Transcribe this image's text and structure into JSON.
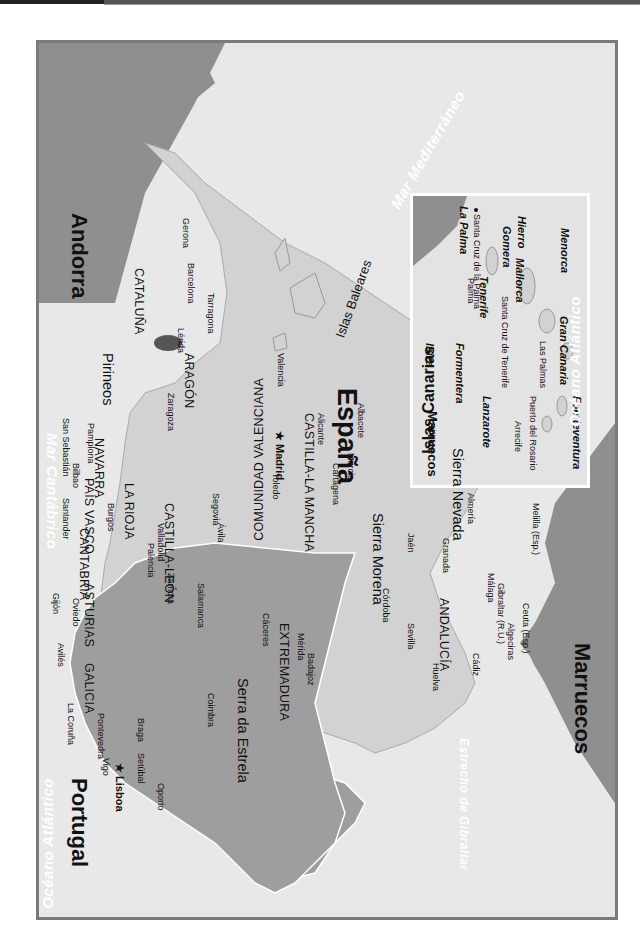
{
  "map": {
    "title": "España y Portugal",
    "orientation": "rotated 90° clockwise (north points right)",
    "colors": {
      "sea": "#e8e8e8",
      "spain_land": "#d2d2d2",
      "portugal_land": "#9e9e9e",
      "foreign_land": "#8f8f8f",
      "andorra": "#555555",
      "frame": "#7a7a7a",
      "sea_label": "#ffffff"
    },
    "countries": [
      {
        "name": "España"
      },
      {
        "name": "Portugal"
      },
      {
        "name": "Andorra"
      },
      {
        "name": "Marruecos"
      }
    ],
    "capitals": [
      {
        "name": "Madrid"
      },
      {
        "name": "Lisboa"
      }
    ],
    "regions": [
      "GALICIA",
      "ASTURIAS",
      "CANTABRIA",
      "PAÍS VASCO",
      "NAVARRA",
      "LA RIOJA",
      "ARAGÓN",
      "CATALUÑA",
      "CASTILLA-LEÓN",
      "CASTILLA-LA MANCHA",
      "COMUNIDAD VALENCIANA",
      "EXTREMADURA",
      "ANDALUCÍA"
    ],
    "mountains": [
      "Pirineos",
      "Sierra Morena",
      "Sierra Nevada",
      "Serra da Estrela"
    ],
    "seas": [
      "Mar Cantábrico",
      "Mar Mediterráneo",
      "Océano Atlántico",
      "Estrecho de Gibraltar"
    ],
    "cities": [
      "Gerona",
      "Barcelona",
      "Tarragona",
      "Lérida",
      "Zaragoza",
      "Valencia",
      "Alicante",
      "Cartagena",
      "Murcia",
      "Albacete",
      "San Sebastián",
      "Bilbao",
      "Pamplona",
      "Santander",
      "Burgos",
      "Gijón",
      "Oviedo",
      "Avilés",
      "La Coruña",
      "Pontevedra",
      "Vigo",
      "Palencia",
      "Valladolid",
      "Zamora",
      "Salamanca",
      "Ávila",
      "Segovia",
      "Toledo",
      "Cáceres",
      "Mérida",
      "Badajoz",
      "Córdoba",
      "Jaén",
      "Granada",
      "Almería",
      "Sevilla",
      "Huelva",
      "Cádiz",
      "Málaga",
      "Algeciras",
      "Gibraltar (R.U.)",
      "Ceuta (Esp.)",
      "Melilla (Esp.)",
      "Braga",
      "Oporto",
      "Coimbra",
      "Setúbal",
      "Palma"
    ],
    "balearics": {
      "group": "Islas Baleares",
      "islands": [
        "Menorca",
        "Mallorca",
        "Ibiza",
        "Formentera"
      ]
    },
    "canarias_inset": {
      "title": "Islas Canarias",
      "islands": [
        "La Palma",
        "Tenerife",
        "Gomera",
        "Hierro",
        "Gran Canaria",
        "Lanzarote",
        "Fuerteventura"
      ],
      "cities": [
        "Santa Cruz de la Palma",
        "Santa Cruz de Tenerife",
        "Las Palmas",
        "Arrecife",
        "Puerto del Rosario"
      ],
      "labels": {
        "sea": "Océano Atlántico",
        "mainland": "Marruecos"
      }
    }
  }
}
